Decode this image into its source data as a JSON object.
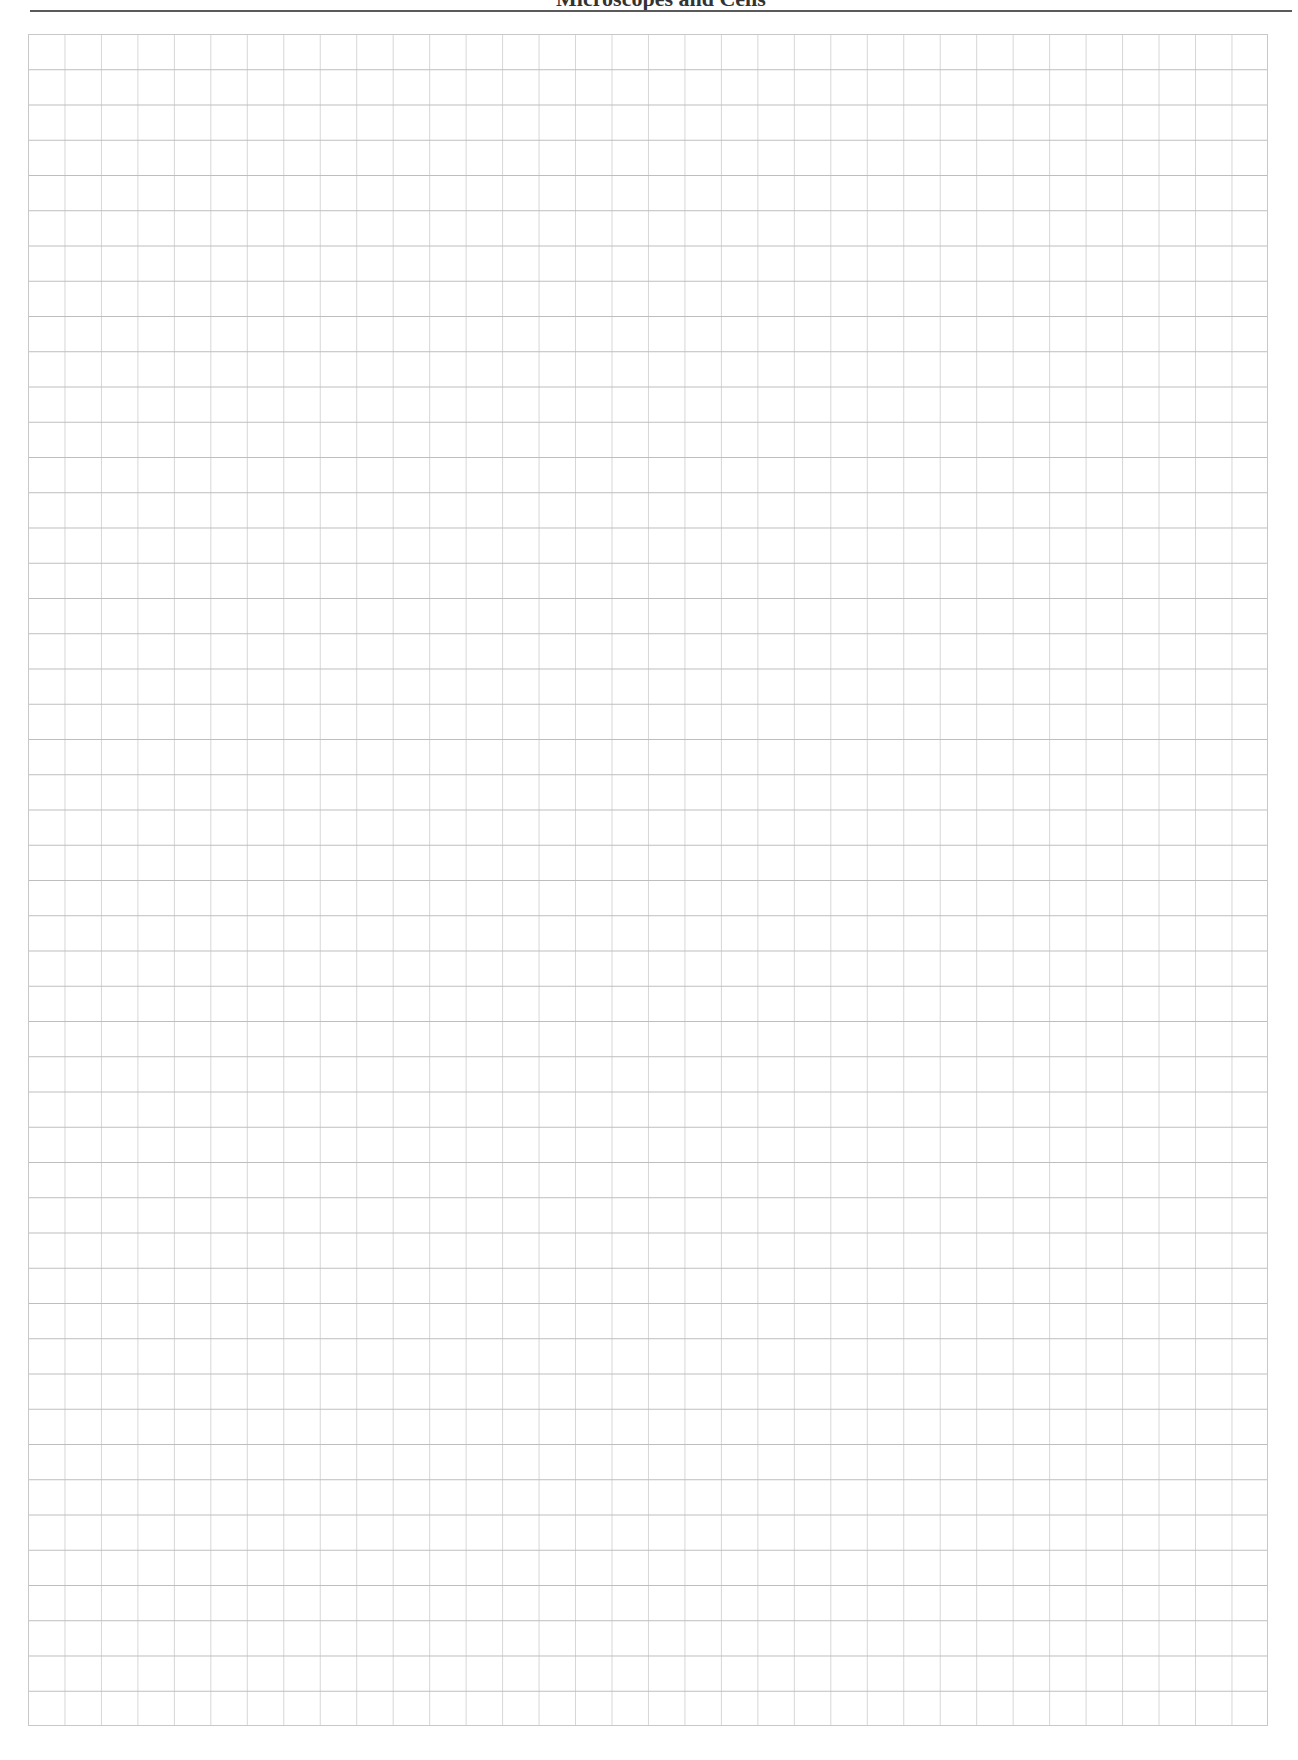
{
  "header": {
    "title": "Microscopes and Cells",
    "rule_color": "#5a5a5a"
  },
  "grid": {
    "columns": 34,
    "rows": 48,
    "line_color_horizontal": "#bdbdbd",
    "line_color_vertical": "#d6d6d6",
    "style": "blank graph paper"
  }
}
